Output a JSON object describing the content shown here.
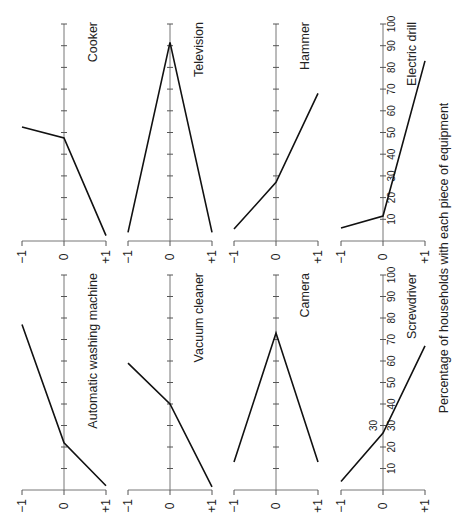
{
  "figure": {
    "caption": "Percentage of households with each piece of equipment",
    "orientation": "rotated-90-ccw",
    "colors": {
      "line": "#111111",
      "axis": "#777777",
      "background": "#ffffff"
    }
  },
  "chart_data": {
    "type": "line",
    "title": "",
    "xlabel": "",
    "ylabel": "Percentage of households with each piece of equipment",
    "x_categories": [
      "-1",
      "0",
      "+1"
    ],
    "x_tick_labels": [
      "−1",
      "0",
      "+1"
    ],
    "ylim": [
      0,
      100
    ],
    "y_ticks": [
      10,
      20,
      30,
      40,
      50,
      60,
      70,
      80,
      90,
      100
    ],
    "y_tick_labels_shown_on": [
      "Electric drill",
      "Screwdriver"
    ],
    "grid": false,
    "legend": null,
    "panels": [
      {
        "name": "Cooker",
        "row": 0,
        "col": 0,
        "values": [
          52.5,
          47.5,
          2.5
        ]
      },
      {
        "name": "Television",
        "row": 0,
        "col": 1,
        "values": [
          4,
          91.5,
          4
        ]
      },
      {
        "name": "Hammer",
        "row": 0,
        "col": 2,
        "values": [
          5.5,
          27,
          68
        ]
      },
      {
        "name": "Electric drill",
        "row": 0,
        "col": 3,
        "values": [
          6,
          11.5,
          83
        ]
      },
      {
        "name": "Automatic washing machine",
        "row": 1,
        "col": 0,
        "values": [
          77,
          22,
          2
        ]
      },
      {
        "name": "Vacuum cleaner",
        "row": 1,
        "col": 1,
        "values": [
          59,
          40,
          1.5
        ]
      },
      {
        "name": "Camera",
        "row": 1,
        "col": 2,
        "values": [
          13,
          73,
          13
        ]
      },
      {
        "name": "Screwdriver",
        "row": 1,
        "col": 3,
        "values": [
          4,
          26.5,
          67
        ],
        "annotation": "30"
      }
    ]
  }
}
